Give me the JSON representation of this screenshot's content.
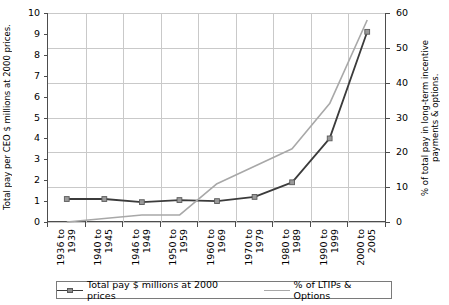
{
  "chart_data": {
    "type": "line",
    "title": "",
    "xlabel": "",
    "ylabel": "Total pay per CEO $ millions at 2000 prices.",
    "ylabel_right": "% of total pay in long-term incentive payments & options.",
    "categories": [
      "1936 to 1939",
      "1940 to 1945",
      "1946 to 1949",
      "1950 to 1959",
      "1960 to 1969",
      "1970 to 1979",
      "1980 to 1989",
      "1990 to 1999",
      "2000 to 2005"
    ],
    "categories_lines": [
      [
        "1936 to",
        "1939"
      ],
      [
        "1940 to",
        "1945"
      ],
      [
        "1946 to",
        "1949"
      ],
      [
        "1950 to",
        "1959"
      ],
      [
        "1960 to",
        "1969"
      ],
      [
        "1970 to",
        "1979"
      ],
      [
        "1980 to",
        "1989"
      ],
      [
        "1990 to",
        "1999"
      ],
      [
        "2000 to",
        "2005"
      ]
    ],
    "ylim": [
      0,
      10
    ],
    "ylim_right": [
      0,
      60
    ],
    "yticks": [
      0,
      1,
      2,
      3,
      4,
      5,
      6,
      7,
      8,
      9,
      10
    ],
    "yticks_right": [
      0,
      10,
      20,
      30,
      40,
      50,
      60
    ],
    "grid": true,
    "legend_position": "bottom",
    "series": [
      {
        "name": "Total pay $ millions at 2000 prices",
        "axis": "left",
        "color": "#3b3b3b",
        "marker": "square",
        "values": [
          1.1,
          1.1,
          0.95,
          1.05,
          1.0,
          1.2,
          1.9,
          4.0,
          9.1
        ]
      },
      {
        "name": "% of LTIPs & Options",
        "axis": "right",
        "color": "#a8a8a8",
        "marker": "none",
        "values": [
          0,
          1,
          2,
          2,
          11,
          16,
          21,
          34,
          58
        ]
      }
    ]
  },
  "legend": {
    "series_1_label": "Total pay $ millions at 2000 prices",
    "series_2_label": "% of LTIPs & Options"
  },
  "colors": {
    "series_dark": "#3b3b3b",
    "series_gray": "#a8a8a8",
    "grid": "#c9c9c9",
    "axis": "#4d4d4d"
  }
}
